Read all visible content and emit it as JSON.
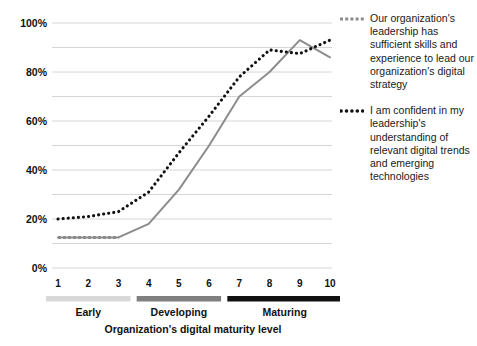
{
  "chart_data": {
    "type": "line",
    "title": "",
    "xlabel": "Organization's digital maturity level",
    "ylabel": "",
    "x": [
      1,
      2,
      3,
      4,
      5,
      6,
      7,
      8,
      9,
      10
    ],
    "xticklabels": [
      "1",
      "2",
      "3",
      "4",
      "5",
      "6",
      "7",
      "8",
      "9",
      "10"
    ],
    "yticklabels": [
      "0%",
      "20%",
      "40%",
      "60%",
      "80%",
      "100%"
    ],
    "ytickvalues": [
      0,
      20,
      40,
      60,
      80,
      100
    ],
    "ylim": [
      0,
      100
    ],
    "xlim": [
      1,
      10
    ],
    "grid": "horizontal-minor-10pct",
    "legend_position": "right",
    "series": [
      {
        "name": "Our organization's leadership has sufficient skills and experience to lead our organization's digital strategy",
        "style": "dashed",
        "color": "#8c8c8c",
        "values": [
          12.5,
          12.5,
          12.5,
          18,
          32,
          50,
          70,
          80,
          93,
          86
        ]
      },
      {
        "name": "I am confident in my leadership's understanding of relevant digital trends and emerging technologies",
        "style": "dotted",
        "color": "#111111",
        "values": [
          20,
          21,
          23,
          31,
          47,
          62,
          78,
          89,
          87.5,
          93
        ]
      }
    ],
    "category_bands": [
      {
        "label": "Early",
        "from": 1,
        "to": 3,
        "color": "#d9d9d9"
      },
      {
        "label": "Developing",
        "from": 4,
        "to": 6,
        "color": "#808080"
      },
      {
        "label": "Maturing",
        "from": 7,
        "to": 10,
        "color": "#111111"
      }
    ]
  },
  "legend": {
    "entries": [
      {
        "marker": "dashed-line-marker",
        "text": "Our organization's leadership has sufficient skills and experience to lead our organization's digital strategy"
      },
      {
        "marker": "dotted-line-marker",
        "text": "I am confident in my leadership's understanding of relevant digital trends and emerging technologies"
      }
    ]
  },
  "colors": {
    "series_dashed": "#8c8c8c",
    "series_dotted": "#111111",
    "gridline": "#d6d6d6",
    "band_early": "#d9d9d9",
    "band_developing": "#808080",
    "band_maturing": "#111111",
    "text": "#1a1a1a",
    "background": "#ffffff"
  }
}
